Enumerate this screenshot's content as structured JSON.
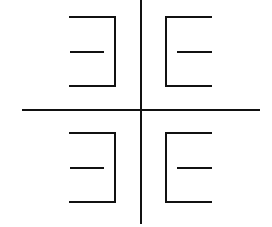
{
  "diagram": {
    "width": 272,
    "height": 227,
    "background": "#ffffff",
    "stroke_color": "#111111",
    "stroke_width": 2,
    "axes": {
      "vertical": {
        "x": 141,
        "y1": 0,
        "y2": 224
      },
      "horizontal": {
        "y": 110,
        "x1": 22,
        "x2": 260
      }
    },
    "shapes": [
      {
        "name": "top-left-reversed-e",
        "orientation": "open-left",
        "spine_x": 115,
        "top_y": 17,
        "middle_y": 52,
        "bottom_y": 86,
        "outer_arm_x": 69,
        "middle_arm_x1": 70,
        "middle_arm_x2": 104
      },
      {
        "name": "top-right-e",
        "orientation": "open-right",
        "spine_x": 166,
        "top_y": 17,
        "middle_y": 52,
        "bottom_y": 86,
        "outer_arm_x": 212,
        "middle_arm_x1": 177,
        "middle_arm_x2": 212
      },
      {
        "name": "bottom-left-reversed-e",
        "orientation": "open-left",
        "spine_x": 115,
        "top_y": 133,
        "middle_y": 168,
        "bottom_y": 202,
        "outer_arm_x": 69,
        "middle_arm_x1": 70,
        "middle_arm_x2": 104
      },
      {
        "name": "bottom-right-e",
        "orientation": "open-right",
        "spine_x": 166,
        "top_y": 133,
        "middle_y": 168,
        "bottom_y": 202,
        "outer_arm_x": 212,
        "middle_arm_x1": 177,
        "middle_arm_x2": 212
      }
    ]
  }
}
